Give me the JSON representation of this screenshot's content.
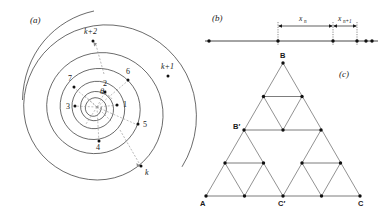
{
  "figure": {
    "width": 385,
    "height": 215,
    "background": "#ffffff",
    "ink": "#1a1a1a"
  },
  "panel_a": {
    "label": "(a)",
    "description": "Archimedean spiral with successive intersection points numbered along increasing angle theta",
    "angle_label": "θ",
    "center": {
      "x": 97,
      "y": 107
    },
    "point_labels": [
      "1",
      "2",
      "3",
      "4",
      "5",
      "6",
      "7"
    ],
    "outer_labels": [
      "k",
      "k+1",
      "k+2"
    ],
    "turn_count": 7,
    "points": [
      {
        "label": "1",
        "x": 117,
        "y": 105,
        "lx": 123,
        "ly": 107
      },
      {
        "label": "2",
        "x": 105,
        "y": 92,
        "lx": 103,
        "ly": 86
      },
      {
        "label": "3",
        "x": 75,
        "y": 106,
        "lx": 68,
        "ly": 109
      },
      {
        "label": "4",
        "x": 99,
        "y": 141,
        "lx": 96,
        "ly": 150
      },
      {
        "label": "5",
        "x": 138,
        "y": 124,
        "lx": 144,
        "ly": 126
      },
      {
        "label": "6",
        "x": 128,
        "y": 80,
        "lx": 127,
        "ly": 74
      },
      {
        "label": "7",
        "x": 74,
        "y": 87,
        "lx": 69,
        "ly": 81
      }
    ],
    "outer_points": [
      {
        "label": "k",
        "x": 141,
        "y": 166,
        "lx": 146,
        "ly": 174
      },
      {
        "label": "k+1",
        "x": 168,
        "y": 76,
        "lx": 163,
        "ly": 68
      },
      {
        "label": "k+2",
        "x": 93,
        "y": 41,
        "lx": 86,
        "ly": 34
      }
    ]
  },
  "panel_b": {
    "label": "(b)",
    "description": "One dimensional line with accumulating points and spacings x_n and x_n+1",
    "measure_labels": [
      {
        "base": "x",
        "sub": "n"
      },
      {
        "base": "x",
        "sub": "n+1"
      }
    ],
    "line": {
      "x1": 205,
      "x2": 378,
      "y": 41
    },
    "dots_x": [
      209,
      278,
      333,
      357,
      367,
      372
    ],
    "ticks_x": [
      278,
      333,
      357
    ]
  },
  "panel_c": {
    "label": "(c)",
    "description": "Sierpinski gasket (level 2) with labelled vertices and midpoints",
    "vertices": [
      {
        "label": "A",
        "x": 206,
        "y": 196,
        "lx": 201,
        "ly": 205
      },
      {
        "label": "B",
        "x": 283,
        "y": 63,
        "lx": 280,
        "ly": 58
      },
      {
        "label": "C",
        "x": 360,
        "y": 196,
        "lx": 360,
        "ly": 205
      },
      {
        "label": "B′",
        "x": 244,
        "y": 130,
        "lx": 234,
        "ly": 128
      },
      {
        "label": "C′",
        "x": 283,
        "y": 196,
        "lx": 279,
        "ly": 205
      }
    ]
  }
}
